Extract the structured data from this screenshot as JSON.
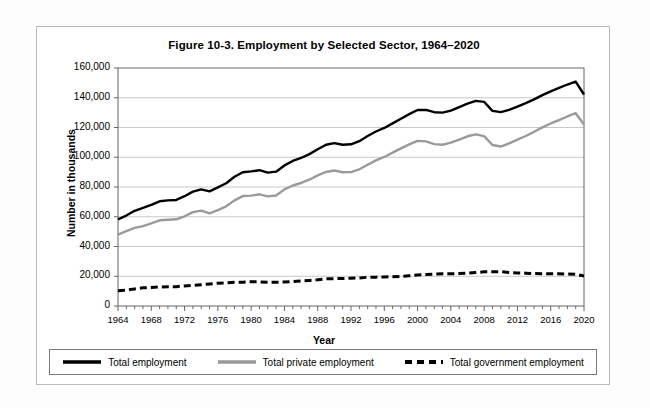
{
  "figure": {
    "title": "Figure 10-3. Employment by Selected Sector, 1964–2020",
    "y_axis_title": "Number in thousands",
    "x_axis_title": "Year"
  },
  "legend": {
    "items": [
      {
        "label": "Total employment",
        "style": "solid",
        "color": "#000000"
      },
      {
        "label": "Total private employment",
        "style": "solid",
        "color": "#9a9a9a"
      },
      {
        "label": "Total government employment",
        "style": "dashed",
        "color": "#000000"
      }
    ]
  },
  "chart_data": {
    "type": "line",
    "title": "Figure 10-3. Employment by Selected Sector, 1964–2020",
    "xlabel": "Year",
    "ylabel": "Number in thousands",
    "xlim": [
      1964,
      2020
    ],
    "ylim": [
      0,
      160000
    ],
    "ytick_labels": [
      "0",
      "20,000",
      "40,000",
      "60,000",
      "80,000",
      "100,000",
      "120,000",
      "140,000",
      "160,000"
    ],
    "yticks": [
      0,
      20000,
      40000,
      60000,
      80000,
      100000,
      120000,
      140000,
      160000
    ],
    "xtick_labels": [
      "1964",
      "1968",
      "1972",
      "1976",
      "1980",
      "1984",
      "1988",
      "1992",
      "1996",
      "2000",
      "2004",
      "2008",
      "2012",
      "2016",
      "2020"
    ],
    "xticks": [
      1964,
      1968,
      1972,
      1976,
      1980,
      1984,
      1988,
      1992,
      1996,
      2000,
      2004,
      2008,
      2012,
      2016,
      2020
    ],
    "minor_xtick_interval": 1,
    "grid": "horizontal",
    "legend_position": "bottom",
    "x": [
      1964,
      1965,
      1966,
      1967,
      1968,
      1969,
      1970,
      1971,
      1972,
      1973,
      1974,
      1975,
      1976,
      1977,
      1978,
      1979,
      1980,
      1981,
      1982,
      1983,
      1984,
      1985,
      1986,
      1987,
      1988,
      1989,
      1990,
      1991,
      1992,
      1993,
      1994,
      1995,
      1996,
      1997,
      1998,
      1999,
      2000,
      2001,
      2002,
      2003,
      2004,
      2005,
      2006,
      2007,
      2008,
      2009,
      2010,
      2011,
      2012,
      2013,
      2014,
      2015,
      2016,
      2017,
      2018,
      2019,
      2020
    ],
    "series": [
      {
        "name": "Total employment",
        "color": "#000000",
        "style": "solid",
        "values": [
          58300,
          60800,
          64000,
          65900,
          68000,
          70400,
          71000,
          71300,
          73800,
          76900,
          78400,
          77100,
          79800,
          82500,
          86900,
          89900,
          90500,
          91300,
          89700,
          90300,
          94500,
          97500,
          99500,
          102100,
          105400,
          108400,
          109500,
          108400,
          108700,
          110800,
          114300,
          117300,
          119700,
          122800,
          125900,
          129000,
          131800,
          131800,
          130300,
          130000,
          131400,
          133700,
          136100,
          137900,
          137200,
          131200,
          130300,
          131800,
          134100,
          136400,
          138900,
          141800,
          144300,
          146600,
          148900,
          150900,
          142200
        ]
      },
      {
        "name": "Total private employment",
        "color": "#9a9a9a",
        "style": "solid",
        "values": [
          48000,
          50300,
          52500,
          53700,
          55500,
          57600,
          58000,
          58300,
          60300,
          63100,
          64100,
          62300,
          64500,
          67000,
          71000,
          73900,
          74200,
          75100,
          73700,
          74300,
          78400,
          81000,
          82700,
          84900,
          87800,
          90100,
          91100,
          89900,
          90000,
          91900,
          95000,
          97900,
          100200,
          103100,
          106000,
          108700,
          111000,
          110700,
          108830,
          108400,
          109800,
          111900,
          114100,
          115400,
          114200,
          108200,
          107200,
          109300,
          111900,
          114300,
          117100,
          120100,
          122700,
          125000,
          127400,
          129600,
          122000
        ]
      },
      {
        "name": "Total government employment",
        "color": "#000000",
        "style": "dashed",
        "values": [
          10300,
          10600,
          11500,
          12200,
          12500,
          12800,
          13000,
          13000,
          13500,
          13800,
          14300,
          14800,
          15300,
          15500,
          15900,
          16000,
          16300,
          16200,
          16000,
          16000,
          16100,
          16500,
          16800,
          17200,
          17600,
          18300,
          18400,
          18500,
          18700,
          18900,
          19300,
          19400,
          19500,
          19700,
          19900,
          20300,
          20800,
          21100,
          21470,
          21600,
          21600,
          21800,
          22000,
          22500,
          23000,
          23000,
          23100,
          22500,
          22200,
          22100,
          21800,
          21700,
          21600,
          21600,
          21500,
          21300,
          20200
        ]
      }
    ]
  }
}
